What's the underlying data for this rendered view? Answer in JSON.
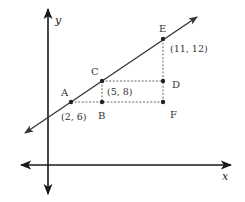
{
  "diagram": {
    "type": "coordinate-plane-line-slope",
    "colors": {
      "axis": "#1a1a1a",
      "line": "#333333",
      "dashed": "#555555",
      "point": "#222222",
      "text": "#333333"
    },
    "axes": {
      "x_label": "x",
      "y_label": "y"
    },
    "points": [
      {
        "id": "A",
        "label": "A",
        "coord_label": "(2, 6)",
        "on_line": true
      },
      {
        "id": "B",
        "label": "B",
        "coord_label": "",
        "on_line": false
      },
      {
        "id": "C",
        "label": "C",
        "coord_label": "(5, 8)",
        "on_line": true
      },
      {
        "id": "D",
        "label": "D",
        "coord_label": "",
        "on_line": false
      },
      {
        "id": "E",
        "label": "E",
        "coord_label": "(11, 12)",
        "on_line": true
      },
      {
        "id": "F",
        "label": "F",
        "coord_label": "",
        "on_line": false
      }
    ],
    "dashed_segments": [
      "A-B",
      "B-F",
      "C-B",
      "C-D",
      "E-F"
    ]
  }
}
